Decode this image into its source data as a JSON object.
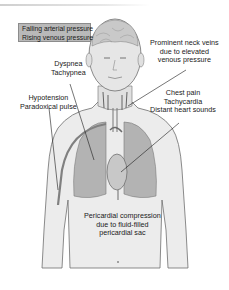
{
  "diagram": {
    "colors": {
      "skin_fill": "#ececec",
      "skin_outline": "#6e6e6e",
      "lung_fill": "#b3b3b3",
      "heart_fill": "#c8c8c8",
      "label_box_fill": "#b9b9b9",
      "label_box_border": "#8c8c8c",
      "leader_line": "#1a1a1a"
    },
    "labels": {
      "pressure_box": {
        "line1": "Falling arterial pressure",
        "line2": "Rising venous pressure"
      },
      "neck_veins": {
        "line1": "Prominent neck veins",
        "line2": "due to elevated",
        "line3": "venous pressure"
      },
      "respiratory": {
        "line1": "Dyspnea",
        "line2": "Tachypnea"
      },
      "circulation": {
        "line1": "Hypotension",
        "line2": "Paradoxical pulse"
      },
      "cardiac": {
        "line1": "Chest pain",
        "line2": "Tachycardia",
        "line3": "Distant heart sounds"
      },
      "pericardium": {
        "line1": "Pericardial compression",
        "line2": "due to fluid-filled",
        "line3": "pericardial sac"
      }
    }
  }
}
